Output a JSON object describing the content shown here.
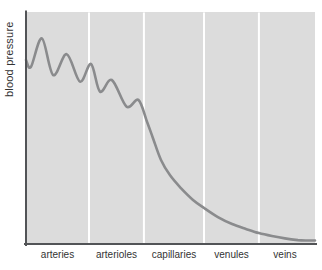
{
  "chart_data": {
    "type": "line",
    "title": "",
    "xlabel": "",
    "ylabel": "blood pressure",
    "categories": [
      "arteries",
      "arterioles",
      "capillaries",
      "venules",
      "veins"
    ],
    "y_axis": {
      "tick_labels_shown": false,
      "range": [
        0,
        100
      ]
    },
    "x_axis": {
      "tick_labels_shown": true,
      "numeric": false
    },
    "legend": "none",
    "grid": "four vertical white divider lines separating the five vessel regions",
    "point_format": "[x percent across plot width, relative pressure 0-100]",
    "series": [
      {
        "name": "blood pressure",
        "points": [
          [
            0,
            79.3
          ],
          [
            1.7,
            76.3
          ],
          [
            5.5,
            88.6
          ],
          [
            9.4,
            72.8
          ],
          [
            14.1,
            81.8
          ],
          [
            18.7,
            70.0
          ],
          [
            22.5,
            77.6
          ],
          [
            25.6,
            65.7
          ],
          [
            29.7,
            70.7
          ],
          [
            34.8,
            59.2
          ],
          [
            38.9,
            62.1
          ],
          [
            41.9,
            52.6
          ],
          [
            43.9,
            45.7
          ],
          [
            46.7,
            36.2
          ],
          [
            49.8,
            29.7
          ],
          [
            53.6,
            24.1
          ],
          [
            57.8,
            19.0
          ],
          [
            61.6,
            15.5
          ],
          [
            66.4,
            11.6
          ],
          [
            71.3,
            8.6
          ],
          [
            76.1,
            6.5
          ],
          [
            80.6,
            4.7
          ],
          [
            85.1,
            3.4
          ],
          [
            89.6,
            2.4
          ],
          [
            94.1,
            1.7
          ],
          [
            97.6,
            1.5
          ],
          [
            100,
            1.5
          ]
        ]
      }
    ]
  },
  "colors": {
    "page_background": "#ffffff",
    "plot_background": "#dcdcdc",
    "curve": "#8a8b8d",
    "axis": "#525457",
    "divider": "#ffffff",
    "label_text": "#333333"
  }
}
